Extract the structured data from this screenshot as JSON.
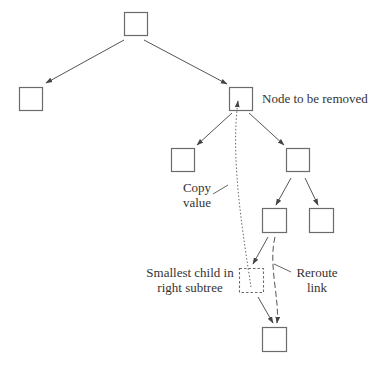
{
  "diagram": {
    "labels": {
      "node_to_remove": "Node to be removed",
      "copy_value_line1": "Copy",
      "copy_value_line2": "value",
      "smallest_child_line1": "Smallest child in",
      "smallest_child_line2": "right subtree",
      "reroute_line1": "Reroute",
      "reroute_line2": "link"
    },
    "colors": {
      "stroke": "#6b6b6b",
      "arrow": "#444444",
      "text": "#333333",
      "background": "#ffffff"
    },
    "nodes": [
      {
        "id": "root",
        "x": 124,
        "y": 12,
        "size": 23,
        "style": "solid"
      },
      {
        "id": "left-child",
        "x": 19,
        "y": 87,
        "size": 23,
        "style": "solid"
      },
      {
        "id": "node-to-remove",
        "x": 229,
        "y": 87,
        "size": 23,
        "style": "solid"
      },
      {
        "id": "remove-left-child",
        "x": 171,
        "y": 148,
        "size": 23,
        "style": "solid"
      },
      {
        "id": "remove-right-child",
        "x": 286,
        "y": 148,
        "size": 23,
        "style": "solid"
      },
      {
        "id": "right-left-child",
        "x": 262,
        "y": 208,
        "size": 24,
        "style": "solid"
      },
      {
        "id": "right-right-child",
        "x": 309,
        "y": 208,
        "size": 24,
        "style": "solid"
      },
      {
        "id": "smallest-child",
        "x": 239,
        "y": 268,
        "size": 24,
        "style": "dashed"
      },
      {
        "id": "smallest-child-right",
        "x": 262,
        "y": 327,
        "size": 24,
        "style": "solid"
      }
    ],
    "edges": [
      {
        "from": "root",
        "to": "left-child",
        "style": "solid"
      },
      {
        "from": "root",
        "to": "node-to-remove",
        "style": "solid"
      },
      {
        "from": "node-to-remove",
        "to": "remove-left-child",
        "style": "solid"
      },
      {
        "from": "node-to-remove",
        "to": "remove-right-child",
        "style": "solid"
      },
      {
        "from": "remove-right-child",
        "to": "right-left-child",
        "style": "solid"
      },
      {
        "from": "remove-right-child",
        "to": "right-right-child",
        "style": "solid"
      },
      {
        "from": "right-left-child",
        "to": "smallest-child",
        "style": "solid"
      },
      {
        "from": "smallest-child",
        "to": "smallest-child-right",
        "style": "solid"
      },
      {
        "from": "smallest-child",
        "to": "node-to-remove",
        "style": "dotted",
        "meaning": "copy value"
      },
      {
        "from": "right-left-child",
        "to": "smallest-child-right",
        "style": "dashed",
        "meaning": "reroute link"
      }
    ]
  }
}
